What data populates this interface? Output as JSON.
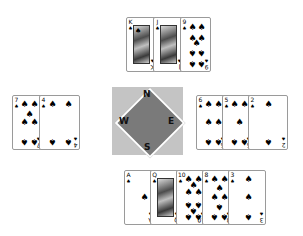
{
  "game": "Bridge deal display",
  "suit_symbol": "♠",
  "compass": {
    "north": "N",
    "south": "S",
    "east": "E",
    "west": "W"
  },
  "hands": {
    "north": {
      "cards": [
        {
          "rank": "K",
          "suit": "♠"
        },
        {
          "rank": "J",
          "suit": "♠"
        },
        {
          "rank": "9",
          "suit": "♠"
        }
      ]
    },
    "west": {
      "cards": [
        {
          "rank": "7",
          "suit": "♠"
        },
        {
          "rank": "4",
          "suit": "♠"
        }
      ]
    },
    "east": {
      "cards": [
        {
          "rank": "6",
          "suit": "♠"
        },
        {
          "rank": "5",
          "suit": "♠"
        },
        {
          "rank": "2",
          "suit": "♠"
        }
      ]
    },
    "south": {
      "cards": [
        {
          "rank": "A",
          "suit": "♠"
        },
        {
          "rank": "Q",
          "suit": "♠"
        },
        {
          "rank": "10",
          "suit": "♠"
        },
        {
          "rank": "8",
          "suit": "♠"
        },
        {
          "rank": "3",
          "suit": "♠"
        }
      ]
    }
  },
  "colors": {
    "background": "#ffffff",
    "compass_square": "#c4c4c4",
    "compass_diamond": "#7a7a7a"
  }
}
